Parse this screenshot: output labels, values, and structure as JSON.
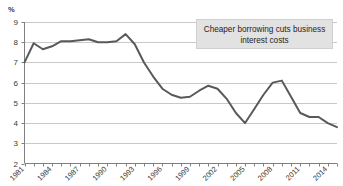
{
  "chart_data": {
    "type": "line",
    "title": "",
    "xlabel": "",
    "ylabel": "%",
    "ylim": [
      2,
      9
    ],
    "xlim": [
      1981,
      2015
    ],
    "grid": true,
    "legend": "none",
    "yticks": [
      2,
      3,
      4,
      5,
      6,
      7,
      8,
      9
    ],
    "xticks": [
      1981,
      1984,
      1987,
      1990,
      1993,
      1996,
      1999,
      2002,
      2005,
      2008,
      2011,
      2014
    ],
    "x": [
      1981,
      1982,
      1983,
      1984,
      1985,
      1986,
      1987,
      1988,
      1989,
      1990,
      1991,
      1992,
      1993,
      1994,
      1995,
      1996,
      1997,
      1998,
      1999,
      2000,
      2001,
      2002,
      2003,
      2004,
      2005,
      2006,
      2007,
      2008,
      2009,
      2010,
      2011,
      2012,
      2013,
      2014,
      2015
    ],
    "values": [
      7.0,
      7.95,
      7.65,
      7.8,
      8.05,
      8.05,
      8.1,
      8.15,
      8.0,
      8.0,
      8.05,
      8.4,
      7.9,
      7.0,
      6.3,
      5.7,
      5.4,
      5.25,
      5.3,
      5.6,
      5.85,
      5.7,
      5.2,
      4.5,
      4.0,
      4.7,
      5.4,
      6.0,
      6.1,
      5.3,
      4.5,
      4.3,
      4.3,
      4.0,
      3.8
    ],
    "annotations": [
      {
        "name": "callout",
        "text_line1": "Cheaper borrowing cuts business",
        "text_line2": "interest costs"
      }
    ],
    "colors": {
      "line": "#595959",
      "grid": "#c9c9c9",
      "axis": "#808080",
      "annotation_fill": "#e2e2e2",
      "text": "#3a3a3a",
      "background": "#ffffff"
    }
  }
}
